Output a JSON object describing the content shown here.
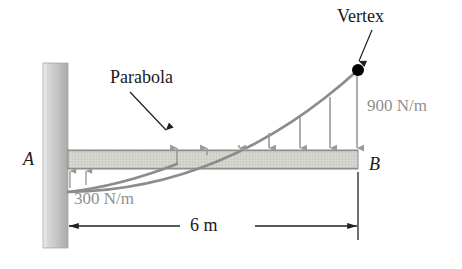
{
  "figure": {
    "type": "engineering-free-body-diagram",
    "canvas": {
      "width": 462,
      "height": 269,
      "background": "#ffffff"
    }
  },
  "labels": {
    "vertex": "Vertex",
    "parabola": "Parabola",
    "load_max": "900 N/m",
    "load_min": "300 N/m",
    "point_a": "A",
    "point_b": "B",
    "span": "6 m"
  },
  "colors": {
    "curve": "#8c8c8c",
    "arrow": "#9a9a9a",
    "beam_fill": "#d9d9d4",
    "beam_edge": "#8a8a85",
    "wall_light": "#e3e3e3",
    "wall_dark": "#b4b4b4",
    "text_dark": "#1a1a1a",
    "text_gray": "#8f8f8f",
    "dimension": "#222222",
    "vertex_dot": "#000000"
  },
  "geometry": {
    "wall": {
      "x": 43,
      "y": 63,
      "width": 25,
      "height": 185
    },
    "beam": {
      "x": 68,
      "y": 150,
      "width": 290,
      "height": 19
    },
    "vertex_point": {
      "x": 358,
      "y": 70
    },
    "curve_start": {
      "x": 68,
      "y": 192
    },
    "dimension_line": {
      "y": 226,
      "x_start": 68,
      "x_end": 358
    },
    "load_arrows_x": [
      177,
      207,
      239,
      269,
      300,
      330,
      358
    ],
    "uplift_arrows_x": [
      70,
      85
    ]
  },
  "annotations": {
    "vertex_leader": {
      "from": {
        "x": 372,
        "y": 30
      },
      "to": {
        "x": 359,
        "y": 64
      }
    },
    "parabola_leader": {
      "from": {
        "x": 130,
        "y": 92
      },
      "to": {
        "x": 166,
        "y": 133
      }
    }
  },
  "load_profile": {
    "note": "Parabolic distributed load, vertex at right end B",
    "left_intensity": "300 N/m",
    "right_intensity": "900 N/m",
    "span_length": "6 m"
  }
}
